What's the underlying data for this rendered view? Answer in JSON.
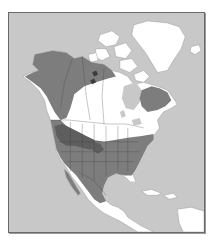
{
  "map": {
    "type": "species range map",
    "region": "North America",
    "style": "grayscale",
    "frame": {
      "x": 8,
      "y": 12,
      "width": 197,
      "height": 221
    },
    "colors": {
      "background": "#ffffff",
      "ocean": "#c8c8c8",
      "land_outside_range": "#ffffff",
      "range": "#7d7d7d",
      "core_range": "#5e5e5e",
      "border": "#6a6a6a",
      "boundary_lines": "#3c3c3c"
    },
    "layers": [
      {
        "id": "ocean",
        "label": "ocean"
      },
      {
        "id": "land",
        "label": "land outside range"
      },
      {
        "id": "range",
        "label": "species range"
      },
      {
        "id": "core",
        "label": "core range"
      },
      {
        "id": "boundaries",
        "label": "state and provincial boundaries"
      }
    ],
    "range_regions": [
      "Alaska",
      "Yukon and Northwest Territories",
      "British Columbia",
      "Northern Quebec and Labrador",
      "Western United States",
      "Eastern United States",
      "Northern Mexico"
    ],
    "core_regions": [
      "Pacific Northwest and Great Basin",
      "Northern Rockies"
    ],
    "labels": []
  }
}
